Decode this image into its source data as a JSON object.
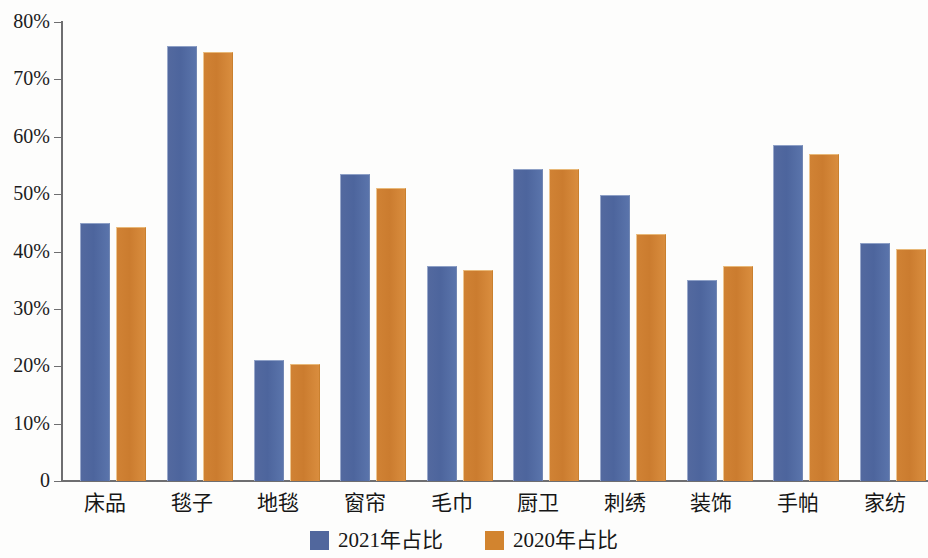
{
  "chart_data": {
    "type": "bar",
    "title": "",
    "xlabel": "",
    "ylabel": "",
    "ylim": [
      0,
      80
    ],
    "yunit": "%",
    "grid": false,
    "legend_position": "bottom-center",
    "ytick_labels": [
      "80%",
      "70%",
      "60%",
      "50%",
      "40%",
      "30%",
      "20%",
      "10%",
      "0"
    ],
    "ytick_values": [
      80,
      70,
      60,
      50,
      40,
      30,
      20,
      10,
      0
    ],
    "categories": [
      "床品",
      "毯子",
      "地毯",
      "窗帘",
      "毛巾",
      "厨卫",
      "刺绣",
      "装饰",
      "手帕",
      "家纺"
    ],
    "series": [
      {
        "name": "2021年占比",
        "color": "#51679d",
        "values": [
          45.0,
          75.8,
          21.1,
          53.5,
          37.4,
          54.4,
          49.8,
          35.0,
          58.5,
          41.5
        ]
      },
      {
        "name": "2020年占比",
        "color": "#d2842f",
        "values": [
          44.2,
          74.7,
          20.4,
          51.0,
          36.7,
          54.4,
          43.1,
          37.5,
          57.0,
          40.5
        ]
      }
    ]
  },
  "legend": {
    "items": [
      {
        "label": "2021年占比",
        "color": "#51679d"
      },
      {
        "label": "2020年占比",
        "color": "#d2842f"
      }
    ]
  }
}
